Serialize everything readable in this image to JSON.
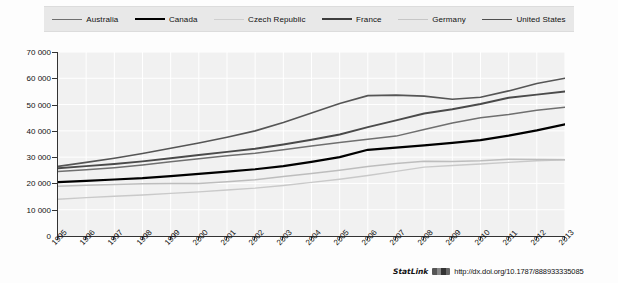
{
  "chart_data": {
    "type": "line",
    "title": "",
    "subtitle": "",
    "xlabel": "",
    "ylabel": "",
    "x": [
      1995,
      1996,
      1997,
      1998,
      1999,
      2000,
      2001,
      2002,
      2003,
      2004,
      2005,
      2006,
      2007,
      2008,
      2009,
      2010,
      2011,
      2012,
      2013
    ],
    "xlim": [
      1995,
      2013
    ],
    "ylim": [
      0,
      70000
    ],
    "yticks": [
      0,
      10000,
      20000,
      30000,
      40000,
      50000,
      60000,
      70000
    ],
    "ytick_labels": [
      "0",
      "10 000",
      "20 000",
      "30 000",
      "40 000",
      "50 000",
      "60 000",
      "70 000"
    ],
    "xtick_labels": [
      "1995",
      "1996",
      "1997",
      "1998",
      "1999",
      "2000",
      "2001",
      "2002",
      "2003",
      "2004",
      "2005",
      "2006",
      "2007",
      "2008",
      "2009",
      "2010",
      "2011",
      "2012",
      "2013"
    ],
    "grid": true,
    "legend_position": "top",
    "series": [
      {
        "name": "Australia",
        "color": "#6f6f6f",
        "width": 1.5,
        "values": [
          24500,
          25200,
          26000,
          27000,
          28200,
          29400,
          30500,
          31500,
          32800,
          34200,
          35600,
          36800,
          38000,
          40500,
          43000,
          45000,
          46200,
          47800,
          49000
        ]
      },
      {
        "name": "Canada",
        "color": "#000000",
        "width": 2.2,
        "values": [
          20500,
          21000,
          21500,
          22000,
          22800,
          23600,
          24500,
          25400,
          26600,
          28200,
          30000,
          32800,
          33600,
          34500,
          35400,
          36500,
          38200,
          40200,
          42500
        ]
      },
      {
        "name": "Czech Republic",
        "color": "#c9c9c9",
        "width": 1.4,
        "values": [
          14000,
          14600,
          15100,
          15600,
          16200,
          16800,
          17500,
          18200,
          19200,
          20400,
          21600,
          23000,
          24600,
          26200,
          26800,
          27400,
          28000,
          28600,
          29000
        ]
      },
      {
        "name": "France",
        "color": "#4a4a4a",
        "width": 1.9,
        "values": [
          25800,
          26600,
          27400,
          28400,
          29600,
          30800,
          32000,
          33200,
          34800,
          36600,
          38600,
          41400,
          44000,
          46600,
          48200,
          50200,
          52600,
          53800,
          55000
        ]
      },
      {
        "name": "Germany",
        "color": "#bdbdbd",
        "width": 1.5,
        "values": [
          18900,
          19300,
          19600,
          19900,
          20000,
          20000,
          20600,
          21400,
          22600,
          23800,
          25000,
          26400,
          27600,
          28400,
          28300,
          28600,
          29200,
          29100,
          29000
        ]
      },
      {
        "name": "United States",
        "color": "#555555",
        "width": 1.6,
        "values": [
          26500,
          28000,
          29600,
          31400,
          33400,
          35400,
          37600,
          40000,
          43200,
          46800,
          50400,
          53400,
          53600,
          53200,
          52000,
          52800,
          55200,
          58000,
          60000
        ]
      }
    ]
  },
  "legend": {
    "items": [
      {
        "label": "Australia",
        "color": "#6f6f6f",
        "width": 1.5
      },
      {
        "label": "Canada",
        "color": "#000000",
        "width": 2.6
      },
      {
        "label": "Czech Republic",
        "color": "#cfcfcf",
        "width": 1.4
      },
      {
        "label": "France",
        "color": "#3d3d3d",
        "width": 2.1
      },
      {
        "label": "Germany",
        "color": "#c6c6c6",
        "width": 1.5
      },
      {
        "label": "United States",
        "color": "#4f4f4f",
        "width": 1.8
      }
    ]
  },
  "footer": {
    "statlink_word": "StatLink",
    "statlink_icon": "statlink-barcode-icon",
    "url": "http://dx.doi.org/10.1787/888933335085"
  }
}
